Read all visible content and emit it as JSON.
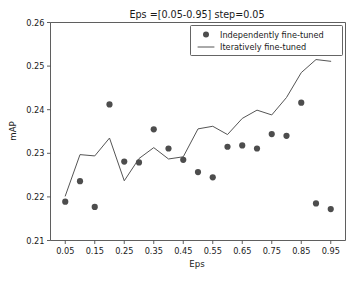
{
  "chart_data": {
    "type": "scatter",
    "title": "Eps =[0.05-0.95] step=0.05",
    "xlabel": "Eps",
    "ylabel": "mAP",
    "xlim": [
      0.0,
      1.0
    ],
    "ylim": [
      0.21,
      0.26
    ],
    "grid": false,
    "legend_position": "upper right",
    "xticks": [
      "0.05",
      "0.15",
      "0.25",
      "0.35",
      "0.45",
      "0.55",
      "0.65",
      "0.75",
      "0.85",
      "0.95"
    ],
    "xtick_values": [
      0.05,
      0.15,
      0.25,
      0.35,
      0.45,
      0.55,
      0.65,
      0.75,
      0.85,
      0.95
    ],
    "yticks": [
      "0.21",
      "0.22",
      "0.23",
      "0.24",
      "0.25",
      "0.26"
    ],
    "ytick_values": [
      0.21,
      0.22,
      0.23,
      0.24,
      0.25,
      0.26
    ],
    "x": [
      0.05,
      0.1,
      0.15,
      0.2,
      0.25,
      0.3,
      0.35,
      0.4,
      0.45,
      0.5,
      0.55,
      0.6,
      0.65,
      0.7,
      0.75,
      0.8,
      0.85,
      0.9,
      0.95
    ],
    "series": [
      {
        "name": "Independently fine-tuned",
        "style": "markers",
        "color": "#4d4d4d",
        "values": [
          0.2189,
          0.2236,
          0.2177,
          0.2412,
          0.2281,
          0.2279,
          0.2355,
          0.2311,
          0.2285,
          0.2257,
          0.2245,
          0.2315,
          0.2318,
          0.2311,
          0.2344,
          0.234,
          0.2416,
          0.2185,
          0.2172
        ]
      },
      {
        "name": "Iteratively fine-tuned",
        "style": "line",
        "color": "#555555",
        "values": [
          0.2202,
          0.2297,
          0.2294,
          0.2335,
          0.2237,
          0.2288,
          0.2313,
          0.2287,
          0.2292,
          0.2356,
          0.2362,
          0.2343,
          0.238,
          0.2399,
          0.2388,
          0.2428,
          0.2485,
          0.2515,
          0.2511
        ]
      }
    ]
  },
  "legend": {
    "entries": [
      {
        "label": "Independently fine-tuned",
        "marker": "dot"
      },
      {
        "label": "Iteratively fine-tuned",
        "marker": "line"
      }
    ]
  }
}
